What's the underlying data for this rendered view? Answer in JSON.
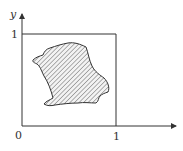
{
  "diagram": {
    "axes": {
      "x_label": "",
      "y_label": "y",
      "origin_label": "0",
      "x_tick_label": "1",
      "y_tick_label": "1"
    },
    "unit_square": {
      "x_range": [
        0,
        1
      ],
      "y_range": [
        0,
        1
      ]
    },
    "region": {
      "description": "irregular hatched region inside unit square",
      "fill": "diagonal hatching"
    },
    "colors": {
      "stroke": "#333333",
      "hatch": "#555555",
      "background": "#ffffff"
    }
  }
}
